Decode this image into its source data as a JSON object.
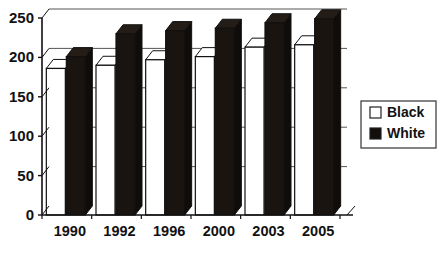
{
  "chart_data": {
    "type": "bar",
    "title": "",
    "subtitle": "",
    "xlabel": "",
    "ylabel": "",
    "categories": [
      "1990",
      "1992",
      "1996",
      "2000",
      "2003",
      "2005"
    ],
    "series": [
      {
        "name": "Black",
        "swatch": "hollow-square",
        "color": "#ffffff",
        "values": [
          186,
          190,
          197,
          201,
          213,
          216
        ]
      },
      {
        "name": "White",
        "swatch": "filled-square",
        "color": "#1a1410",
        "values": [
          201,
          230,
          234,
          237,
          244,
          249
        ]
      }
    ],
    "ylim": [
      0,
      250
    ],
    "yticks": [
      0,
      50,
      100,
      150,
      200,
      250
    ],
    "ytick_labels": [
      "0",
      "50",
      "100",
      "150",
      "200",
      "250"
    ],
    "grid": true,
    "grid_axis": "y",
    "legend_position": "right",
    "style": "3d-columns",
    "axis_color": "#111111",
    "grid_color": "#555555"
  },
  "legend": {
    "entries": [
      {
        "label": "Black",
        "swatch": "hollow-square"
      },
      {
        "label": "White",
        "swatch": "filled-square"
      }
    ]
  }
}
